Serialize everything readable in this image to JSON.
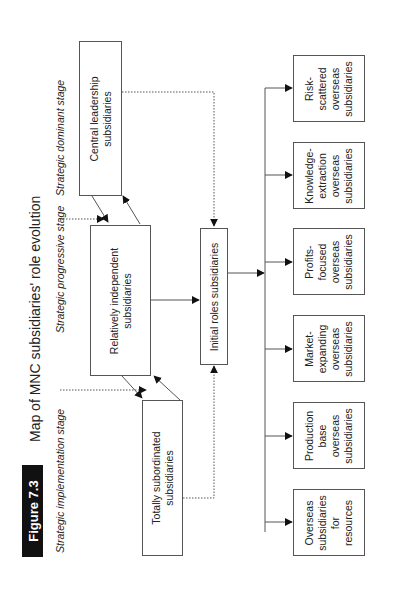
{
  "figure": {
    "badge": "Figure 7.3",
    "title": "Map of MNC subsidiaries' role evolution",
    "orientation": "rotated 90deg counter-clockwise"
  },
  "stages": [
    {
      "id": "dominant",
      "label": "Strategic dominant stage"
    },
    {
      "id": "progressive",
      "label": "Strategic progressive stage"
    },
    {
      "id": "implementation",
      "label": "Strategic implementation stage"
    }
  ],
  "nodes": {
    "central": {
      "label": "Central leadership\nsubsidiaries"
    },
    "independent": {
      "label": "Relatively independent\nsubsidiaries"
    },
    "subordinated": {
      "label": "Totally subordinated\nsubsidiaries"
    },
    "initial": {
      "label": "Initial roles subsidiaries"
    }
  },
  "outcomes": [
    {
      "id": "risk",
      "label": "Risk-\nscattered\noverseas\nsubsidiaries"
    },
    {
      "id": "knowledge",
      "label": "Knowledge-\nextraction\noverseas\nsubsidiaries"
    },
    {
      "id": "profits",
      "label": "Profits-\nfocused\noverseas\nsubsidiaries"
    },
    {
      "id": "market",
      "label": "Market-\nexpanding\noverseas\nsubsidiaries"
    },
    {
      "id": "production",
      "label": "Production\nbase\noverseas\nsubsidiaries"
    },
    {
      "id": "resources",
      "label": "Overseas\nsubsidiaries\nfor\nresources"
    }
  ],
  "edges": [
    {
      "from": "independent",
      "to": "central",
      "style": "solid"
    },
    {
      "from": "central",
      "to": "independent",
      "style": "solid"
    },
    {
      "from": "subordinated",
      "to": "independent",
      "style": "solid"
    },
    {
      "from": "independent",
      "to": "subordinated",
      "style": "solid"
    },
    {
      "from": "central",
      "to": "initial",
      "style": "dotted"
    },
    {
      "from": "subordinated",
      "to": "initial",
      "style": "dotted"
    },
    {
      "from": "independent",
      "to": "initial",
      "style": "solid"
    },
    {
      "from": "initial",
      "to": "outcomes",
      "style": "solid"
    }
  ],
  "colors": {
    "line": "#444444",
    "badge_bg": "#111111",
    "badge_text": "#ffffff"
  }
}
